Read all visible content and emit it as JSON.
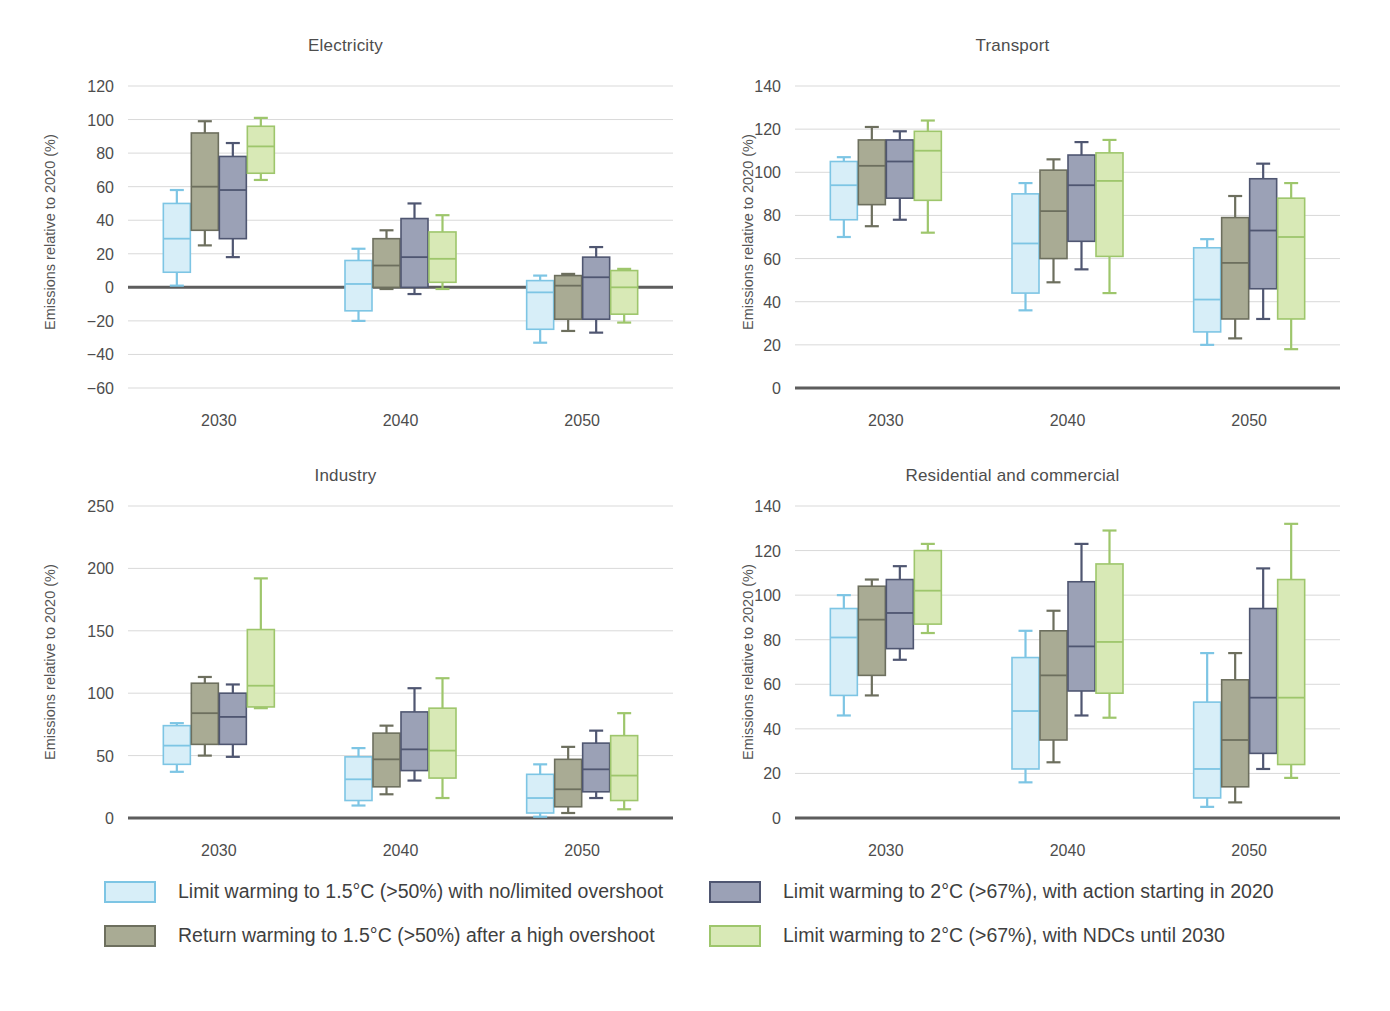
{
  "chart_data": {
    "type": "box",
    "title": "",
    "ylabel": "Emissions relative to 2020 (%)",
    "xlabel": "",
    "categories": [
      "2030",
      "2040",
      "2050"
    ],
    "grid": true,
    "legend_position": "bottom",
    "series_colors": {
      "limit_15": {
        "fill": "#d7eef8",
        "stroke": "#7dc5e4"
      },
      "return_15": {
        "fill": "#a9ab94",
        "stroke": "#6d6f5e"
      },
      "limit_2_2020": {
        "fill": "#9ba1b6",
        "stroke": "#4f5671"
      },
      "limit_2_ndc": {
        "fill": "#d8e9b6",
        "stroke": "#9ec66c"
      }
    },
    "series_names": [
      "Limit warming to 1.5°C (>50%) with no/limited overshoot",
      "Return warming to 1.5°C (>50%) after a high overshoot",
      "Limit warming to 2°C (>67%), with action starting in 2020",
      "Limit warming to 2°C (>67%), with NDCs until 2030"
    ],
    "panels": [
      {
        "id": "electricity",
        "title": "Electricity",
        "ylim": [
          -60,
          120
        ],
        "yticks": [
          -60,
          -40,
          -20,
          0,
          20,
          40,
          60,
          80,
          100,
          120
        ],
        "ytick_labels": [
          "−60",
          "−40",
          "−20",
          "0",
          "20",
          "40",
          "60",
          "80",
          "100",
          "120"
        ],
        "zero_line": 0,
        "groups": [
          {
            "category": "2030",
            "boxes": [
              {
                "series": "limit_15",
                "whisker_low": 1,
                "q1": 9,
                "median": 29,
                "q3": 50,
                "whisker_high": 58
              },
              {
                "series": "return_15",
                "whisker_low": 25,
                "q1": 34,
                "median": 60,
                "q3": 92,
                "whisker_high": 99
              },
              {
                "series": "limit_2_2020",
                "whisker_low": 18,
                "q1": 29,
                "median": 58,
                "q3": 78,
                "whisker_high": 86
              },
              {
                "series": "limit_2_ndc",
                "whisker_low": 64,
                "q1": 68,
                "median": 84,
                "q3": 96,
                "whisker_high": 101
              }
            ]
          },
          {
            "category": "2040",
            "boxes": [
              {
                "series": "limit_15",
                "whisker_low": -20,
                "q1": -14,
                "median": 2,
                "q3": 16,
                "whisker_high": 23
              },
              {
                "series": "return_15",
                "whisker_low": -1,
                "q1": 0,
                "median": 13,
                "q3": 29,
                "whisker_high": 34
              },
              {
                "series": "limit_2_2020",
                "whisker_low": -4,
                "q1": 0,
                "median": 18,
                "q3": 41,
                "whisker_high": 50
              },
              {
                "series": "limit_2_ndc",
                "whisker_low": -1,
                "q1": 3,
                "median": 17,
                "q3": 33,
                "whisker_high": 43
              }
            ]
          },
          {
            "category": "2050",
            "boxes": [
              {
                "series": "limit_15",
                "whisker_low": -33,
                "q1": -25,
                "median": -3,
                "q3": 4,
                "whisker_high": 7
              },
              {
                "series": "return_15",
                "whisker_low": -26,
                "q1": -19,
                "median": 1,
                "q3": 7,
                "whisker_high": 8
              },
              {
                "series": "limit_2_2020",
                "whisker_low": -27,
                "q1": -19,
                "median": 6,
                "q3": 18,
                "whisker_high": 24
              },
              {
                "series": "limit_2_ndc",
                "whisker_low": -21,
                "q1": -16,
                "median": 0,
                "q3": 10,
                "whisker_high": 11
              }
            ]
          }
        ]
      },
      {
        "id": "transport",
        "title": "Transport",
        "ylim": [
          0,
          140
        ],
        "yticks": [
          0,
          20,
          40,
          60,
          80,
          100,
          120,
          140
        ],
        "ytick_labels": [
          "0",
          "20",
          "40",
          "60",
          "80",
          "100",
          "120",
          "140"
        ],
        "zero_line": 0,
        "groups": [
          {
            "category": "2030",
            "boxes": [
              {
                "series": "limit_15",
                "whisker_low": 70,
                "q1": 78,
                "median": 94,
                "q3": 105,
                "whisker_high": 107
              },
              {
                "series": "return_15",
                "whisker_low": 75,
                "q1": 85,
                "median": 103,
                "q3": 115,
                "whisker_high": 121
              },
              {
                "series": "limit_2_2020",
                "whisker_low": 78,
                "q1": 88,
                "median": 105,
                "q3": 115,
                "whisker_high": 119
              },
              {
                "series": "limit_2_ndc",
                "whisker_low": 72,
                "q1": 87,
                "median": 110,
                "q3": 119,
                "whisker_high": 124
              }
            ]
          },
          {
            "category": "2040",
            "boxes": [
              {
                "series": "limit_15",
                "whisker_low": 36,
                "q1": 44,
                "median": 67,
                "q3": 90,
                "whisker_high": 95
              },
              {
                "series": "return_15",
                "whisker_low": 49,
                "q1": 60,
                "median": 82,
                "q3": 101,
                "whisker_high": 106
              },
              {
                "series": "limit_2_2020",
                "whisker_low": 55,
                "q1": 68,
                "median": 94,
                "q3": 108,
                "whisker_high": 114
              },
              {
                "series": "limit_2_ndc",
                "whisker_low": 44,
                "q1": 61,
                "median": 96,
                "q3": 109,
                "whisker_high": 115
              }
            ]
          },
          {
            "category": "2050",
            "boxes": [
              {
                "series": "limit_15",
                "whisker_low": 20,
                "q1": 26,
                "median": 41,
                "q3": 65,
                "whisker_high": 69
              },
              {
                "series": "return_15",
                "whisker_low": 23,
                "q1": 32,
                "median": 58,
                "q3": 79,
                "whisker_high": 89
              },
              {
                "series": "limit_2_2020",
                "whisker_low": 32,
                "q1": 46,
                "median": 73,
                "q3": 97,
                "whisker_high": 104
              },
              {
                "series": "limit_2_ndc",
                "whisker_low": 18,
                "q1": 32,
                "median": 70,
                "q3": 88,
                "whisker_high": 95
              }
            ]
          }
        ]
      },
      {
        "id": "industry",
        "title": "Industry",
        "ylim": [
          0,
          250
        ],
        "yticks": [
          0,
          50,
          100,
          150,
          200,
          250
        ],
        "ytick_labels": [
          "0",
          "50",
          "100",
          "150",
          "200",
          "250"
        ],
        "zero_line": 0,
        "groups": [
          {
            "category": "2030",
            "boxes": [
              {
                "series": "limit_15",
                "whisker_low": 37,
                "q1": 43,
                "median": 58,
                "q3": 74,
                "whisker_high": 76
              },
              {
                "series": "return_15",
                "whisker_low": 50,
                "q1": 59,
                "median": 84,
                "q3": 108,
                "whisker_high": 113
              },
              {
                "series": "limit_2_2020",
                "whisker_low": 49,
                "q1": 59,
                "median": 81,
                "q3": 100,
                "whisker_high": 107
              },
              {
                "series": "limit_2_ndc",
                "whisker_low": 88,
                "q1": 89,
                "median": 106,
                "q3": 151,
                "whisker_high": 192
              }
            ]
          },
          {
            "category": "2040",
            "boxes": [
              {
                "series": "limit_15",
                "whisker_low": 10,
                "q1": 14,
                "median": 31,
                "q3": 49,
                "whisker_high": 56
              },
              {
                "series": "return_15",
                "whisker_low": 19,
                "q1": 25,
                "median": 47,
                "q3": 68,
                "whisker_high": 74
              },
              {
                "series": "limit_2_2020",
                "whisker_low": 30,
                "q1": 38,
                "median": 55,
                "q3": 85,
                "whisker_high": 104
              },
              {
                "series": "limit_2_ndc",
                "whisker_low": 16,
                "q1": 32,
                "median": 54,
                "q3": 88,
                "whisker_high": 112
              }
            ]
          },
          {
            "category": "2050",
            "boxes": [
              {
                "series": "limit_15",
                "whisker_low": 1,
                "q1": 4,
                "median": 16,
                "q3": 35,
                "whisker_high": 43
              },
              {
                "series": "return_15",
                "whisker_low": 4,
                "q1": 9,
                "median": 23,
                "q3": 47,
                "whisker_high": 57
              },
              {
                "series": "limit_2_2020",
                "whisker_low": 16,
                "q1": 21,
                "median": 39,
                "q3": 60,
                "whisker_high": 70
              },
              {
                "series": "limit_2_ndc",
                "whisker_low": 7,
                "q1": 14,
                "median": 34,
                "q3": 66,
                "whisker_high": 84
              }
            ]
          }
        ]
      },
      {
        "id": "residential",
        "title": "Residential and commercial",
        "ylim": [
          0,
          140
        ],
        "yticks": [
          0,
          20,
          40,
          60,
          80,
          100,
          120,
          140
        ],
        "ytick_labels": [
          "0",
          "20",
          "40",
          "60",
          "80",
          "100",
          "120",
          "140"
        ],
        "zero_line": 0,
        "groups": [
          {
            "category": "2030",
            "boxes": [
              {
                "series": "limit_15",
                "whisker_low": 46,
                "q1": 55,
                "median": 81,
                "q3": 94,
                "whisker_high": 100
              },
              {
                "series": "return_15",
                "whisker_low": 55,
                "q1": 64,
                "median": 89,
                "q3": 104,
                "whisker_high": 107
              },
              {
                "series": "limit_2_2020",
                "whisker_low": 71,
                "q1": 76,
                "median": 92,
                "q3": 107,
                "whisker_high": 113
              },
              {
                "series": "limit_2_ndc",
                "whisker_low": 83,
                "q1": 87,
                "median": 102,
                "q3": 120,
                "whisker_high": 123
              }
            ]
          },
          {
            "category": "2040",
            "boxes": [
              {
                "series": "limit_15",
                "whisker_low": 16,
                "q1": 22,
                "median": 48,
                "q3": 72,
                "whisker_high": 84
              },
              {
                "series": "return_15",
                "whisker_low": 25,
                "q1": 35,
                "median": 64,
                "q3": 84,
                "whisker_high": 93
              },
              {
                "series": "limit_2_2020",
                "whisker_low": 46,
                "q1": 57,
                "median": 77,
                "q3": 106,
                "whisker_high": 123
              },
              {
                "series": "limit_2_ndc",
                "whisker_low": 45,
                "q1": 56,
                "median": 79,
                "q3": 114,
                "whisker_high": 129
              }
            ]
          },
          {
            "category": "2050",
            "boxes": [
              {
                "series": "limit_15",
                "whisker_low": 5,
                "q1": 9,
                "median": 22,
                "q3": 52,
                "whisker_high": 74
              },
              {
                "series": "return_15",
                "whisker_low": 7,
                "q1": 14,
                "median": 35,
                "q3": 62,
                "whisker_high": 74
              },
              {
                "series": "limit_2_2020",
                "whisker_low": 22,
                "q1": 29,
                "median": 54,
                "q3": 94,
                "whisker_high": 112
              },
              {
                "series": "limit_2_ndc",
                "whisker_low": 18,
                "q1": 24,
                "median": 54,
                "q3": 107,
                "whisker_high": 132
              }
            ]
          }
        ]
      }
    ],
    "legend": [
      {
        "key": "limit_15",
        "label": "Limit warming to 1.5°C (>50%) with no/limited overshoot"
      },
      {
        "key": "return_15",
        "label": "Return warming to 1.5°C (>50%) after a high overshoot"
      },
      {
        "key": "limit_2_2020",
        "label": "Limit warming to 2°C (>67%), with action starting in 2020"
      },
      {
        "key": "limit_2_ndc",
        "label": "Limit warming to 2°C (>67%), with NDCs until 2030"
      }
    ]
  }
}
